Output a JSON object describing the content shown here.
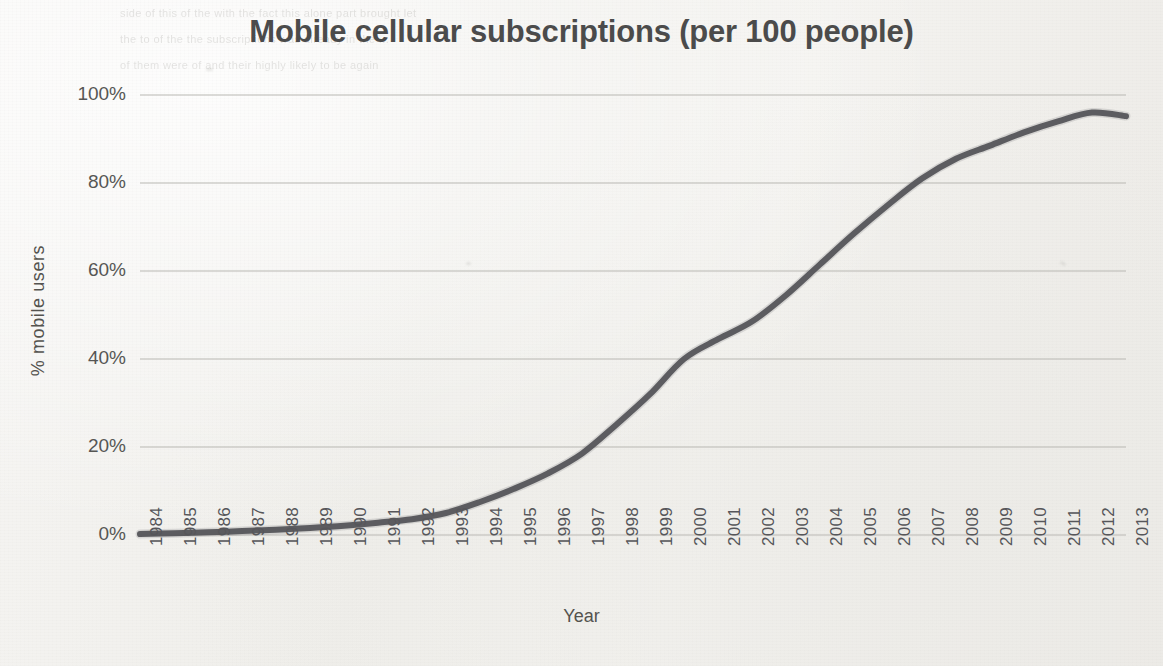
{
  "chart_data": {
    "type": "line",
    "title": "Mobile cellular subscriptions (per 100 people)",
    "xlabel": "Year",
    "ylabel": "% mobile users",
    "grid": true,
    "legend": "none",
    "xlim": [
      1984,
      2013
    ],
    "ylim": [
      0,
      100
    ],
    "ytick_labels": [
      "100%",
      "80%",
      "60%",
      "40%",
      "20%",
      "0%"
    ],
    "ytick_values": [
      100,
      80,
      60,
      40,
      20,
      0
    ],
    "categories": [
      "1984",
      "1985",
      "1986",
      "1987",
      "1988",
      "1989",
      "1990",
      "1991",
      "1992",
      "1993",
      "1994",
      "1995",
      "1996",
      "1997",
      "1998",
      "1999",
      "2000",
      "2001",
      "2002",
      "2003",
      "2004",
      "2005",
      "2006",
      "2007",
      "2008",
      "2009",
      "2010",
      "2011",
      "2012",
      "2013"
    ],
    "series": [
      {
        "name": "% mobile users",
        "color": "#55555a",
        "values": [
          0.2,
          0.4,
          0.6,
          0.9,
          1.2,
          1.6,
          2.1,
          2.8,
          3.6,
          5.0,
          7.5,
          10.5,
          14.0,
          18.5,
          25.0,
          32.0,
          40.0,
          44.5,
          48.5,
          54.5,
          61.5,
          68.5,
          75.0,
          81.0,
          85.5,
          88.5,
          91.5,
          94.0,
          96.0,
          95.2
        ]
      }
    ]
  },
  "bleed_text": {
    "line1": "   side of this   of the      with the          fact      this  alone           part       brought       let",
    "line2": "                  the   to   of  the   the    subscriptions   was   already   in  the   ...",
    "line3": "         of  them   were     of      and    their    highly    likely    to    be     again"
  }
}
